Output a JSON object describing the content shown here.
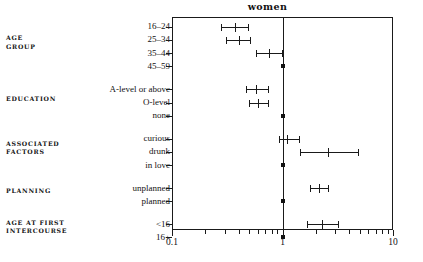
{
  "chart_data": {
    "type": "scatter",
    "title": "women",
    "xlabel": "",
    "ylabel": "",
    "scale": "log",
    "xlim": [
      0.1,
      10
    ],
    "grid": false,
    "legend": null,
    "reference_value": 1,
    "x_tick_labels": [
      "0.1",
      "1",
      "10"
    ],
    "x_tick_values": [
      0.1,
      1,
      10
    ],
    "x_minor_ticks": [
      0.2,
      0.3,
      0.4,
      0.5,
      0.6,
      0.7,
      0.8,
      0.9,
      2,
      3,
      4,
      5,
      6,
      7,
      8,
      9
    ],
    "groups": [
      {
        "name": "AGE GROUP",
        "lines": [
          "AGE",
          "GROUP"
        ],
        "rows": [
          {
            "label": "16–24",
            "odds_ratio": 0.37,
            "ci_low": 0.28,
            "ci_high": 0.49,
            "reference": false
          },
          {
            "label": "25–34",
            "odds_ratio": 0.4,
            "ci_low": 0.31,
            "ci_high": 0.51,
            "reference": false
          },
          {
            "label": "35–44",
            "odds_ratio": 0.75,
            "ci_low": 0.57,
            "ci_high": 0.98,
            "reference": false
          },
          {
            "label": "45–59",
            "odds_ratio": 1.0,
            "ci_low": null,
            "ci_high": null,
            "reference": true
          }
        ]
      },
      {
        "name": "EDUCATION",
        "lines": [
          "EDUCATION"
        ],
        "rows": [
          {
            "label": "A-level or above",
            "odds_ratio": 0.58,
            "ci_low": 0.47,
            "ci_high": 0.74,
            "reference": false
          },
          {
            "label": "O-level",
            "odds_ratio": 0.6,
            "ci_low": 0.5,
            "ci_high": 0.74,
            "reference": false
          },
          {
            "label": "none",
            "odds_ratio": 1.0,
            "ci_low": null,
            "ci_high": null,
            "reference": true
          }
        ]
      },
      {
        "name": "ASSOCIATED FACTORS",
        "lines": [
          "ASSOCIATED",
          "FACTORS"
        ],
        "rows": [
          {
            "label": "curious",
            "odds_ratio": 1.1,
            "ci_low": 0.93,
            "ci_high": 1.42,
            "reference": false
          },
          {
            "label": "drunk",
            "odds_ratio": 2.6,
            "ci_low": 1.45,
            "ci_high": 4.85,
            "reference": false
          },
          {
            "label": "in love",
            "odds_ratio": 1.0,
            "ci_low": null,
            "ci_high": null,
            "reference": true
          }
        ]
      },
      {
        "name": "PLANNING",
        "lines": [
          "PLANNING"
        ],
        "rows": [
          {
            "label": "unplanned",
            "odds_ratio": 2.15,
            "ci_low": 1.78,
            "ci_high": 2.6,
            "reference": false
          },
          {
            "label": "planned",
            "odds_ratio": 1.0,
            "ci_low": null,
            "ci_high": null,
            "reference": true
          }
        ]
      },
      {
        "name": "AGE AT FIRST INTERCOURSE",
        "lines": [
          "AGE AT FIRST",
          "INTERCOURSE"
        ],
        "rows": [
          {
            "label": "<16",
            "odds_ratio": 2.3,
            "ci_low": 1.66,
            "ci_high": 3.15,
            "reference": false
          },
          {
            "label": "16+",
            "odds_ratio": 1.0,
            "ci_low": null,
            "ci_high": null,
            "reference": true
          }
        ]
      }
    ]
  }
}
